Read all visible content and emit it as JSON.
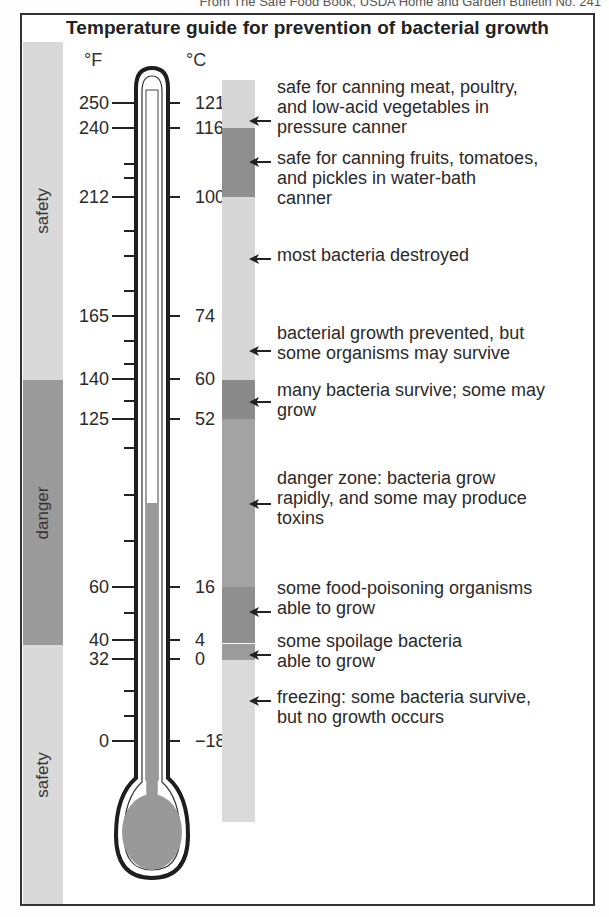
{
  "source_line": "From The Safe Food Book, USDA Home and Garden Bulletin No. 241",
  "title": "Temperature guide for prevention of bacterial growth",
  "units": {
    "fahrenheit": "°F",
    "celsius": "°C"
  },
  "zones_left": [
    {
      "label": "safety",
      "from_y": 42,
      "to_y": 380,
      "color": "#d9d9d9"
    },
    {
      "label": "danger",
      "from_y": 380,
      "to_y": 645,
      "color": "#9a9a9a"
    },
    {
      "label": "safety",
      "from_y": 645,
      "to_y": 904,
      "color": "#d9d9d9"
    }
  ],
  "ticks": [
    {
      "f": "250",
      "c": "121",
      "y": 103
    },
    {
      "f": "240",
      "c": "116",
      "y": 128
    },
    {
      "f": "212",
      "c": "100",
      "y": 197
    },
    {
      "f": "165",
      "c": "74",
      "y": 316
    },
    {
      "f": "140",
      "c": "60",
      "y": 379
    },
    {
      "f": "125",
      "c": "52",
      "y": 419
    },
    {
      "f": "60",
      "c": "16",
      "y": 587
    },
    {
      "f": "40",
      "c": "4",
      "y": 640
    },
    {
      "f": "32",
      "c": "0",
      "y": 659
    },
    {
      "f": "0",
      "c": "−18",
      "y": 741
    }
  ],
  "right_bar_segments": [
    {
      "from_y": 80,
      "to_y": 128,
      "color": "#d6d6d6"
    },
    {
      "from_y": 128,
      "to_y": 197,
      "color": "#8f8f8f"
    },
    {
      "from_y": 197,
      "to_y": 380,
      "color": "#d6d6d6"
    },
    {
      "from_y": 380,
      "to_y": 419,
      "color": "#8a8a8a"
    },
    {
      "from_y": 419,
      "to_y": 587,
      "color": "#a3a3a3"
    },
    {
      "from_y": 587,
      "to_y": 643,
      "color": "#8f8f8f"
    },
    {
      "from_y": 644,
      "to_y": 660,
      "color": "#9c9c9c"
    },
    {
      "from_y": 660,
      "to_y": 822,
      "color": "#dadada"
    }
  ],
  "annotations": [
    {
      "text": "safe for canning meat, poultry,\nand low-acid vegetables in\npressure canner",
      "arrow_y": 117,
      "text_y": 77
    },
    {
      "text": "safe for canning fruits, tomatoes,\nand pickles in water-bath\ncanner",
      "arrow_y": 158,
      "text_y": 148
    },
    {
      "text": "most bacteria destroyed",
      "arrow_y": 255,
      "text_y": 245
    },
    {
      "text": "bacterial growth prevented, but\nsome organisms may survive",
      "arrow_y": 347,
      "text_y": 323
    },
    {
      "text": "many bacteria survive; some may\ngrow",
      "arrow_y": 398,
      "text_y": 380
    },
    {
      "text": "danger zone: bacteria grow\nrapidly, and some may produce\ntoxins",
      "arrow_y": 500,
      "text_y": 468
    },
    {
      "text": "some food-poisoning organisms\nable to grow",
      "arrow_y": 608,
      "text_y": 578
    },
    {
      "text": "some spoilage bacteria\nable to grow",
      "arrow_y": 651,
      "text_y": 631
    },
    {
      "text": "freezing: some bacteria survive,\nbut no growth occurs",
      "arrow_y": 697,
      "text_y": 687
    }
  ],
  "thermometer": {
    "mercury_top_y": 503,
    "fill_color": "#999999"
  }
}
